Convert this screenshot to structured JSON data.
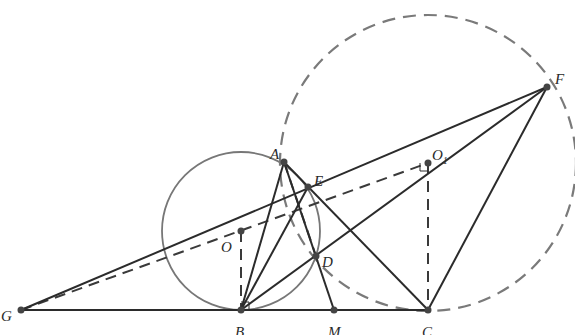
{
  "figure": {
    "type": "geometry-construction",
    "colors": {
      "solid_line": "#2b2b2b",
      "dashed_line": "#3a3a3a",
      "circle_O": "#777777",
      "circle_O1": "#7a7a7a",
      "point": "#444444",
      "label": "#2a2a2a"
    },
    "points": {
      "A": {
        "label": "A",
        "x": 284,
        "y": 162
      },
      "E": {
        "label": "E",
        "x": 308,
        "y": 187
      },
      "O": {
        "label": "O",
        "x": 241,
        "y": 231
      },
      "O1": {
        "label": "O",
        "sub": "1",
        "x": 428,
        "y": 163
      },
      "F": {
        "label": "F",
        "x": 547,
        "y": 87
      },
      "G": {
        "label": "G",
        "x": 21,
        "y": 310
      },
      "B": {
        "label": "B",
        "x": 241,
        "y": 310
      },
      "M": {
        "label": "M",
        "x": 334,
        "y": 310
      },
      "C": {
        "label": "C",
        "x": 428,
        "y": 310
      },
      "D": {
        "label": "D",
        "x": 316,
        "y": 256
      }
    },
    "circles": [
      {
        "name": "circle-O",
        "center": "O",
        "radius": 79,
        "style": "solid"
      },
      {
        "name": "circle-O1",
        "center": "O1",
        "radius": 148,
        "style": "dashed"
      }
    ],
    "segments_solid": [
      [
        "G",
        "C"
      ],
      [
        "G",
        "F"
      ],
      [
        "B",
        "A"
      ],
      [
        "B",
        "E"
      ],
      [
        "B",
        "F"
      ],
      [
        "A",
        "M"
      ],
      [
        "A",
        "C"
      ],
      [
        "C",
        "F"
      ]
    ],
    "segments_dashed": [
      [
        "G",
        "O1"
      ],
      [
        "O",
        "B"
      ],
      [
        "O1",
        "C"
      ],
      [
        "A",
        "D"
      ]
    ]
  }
}
